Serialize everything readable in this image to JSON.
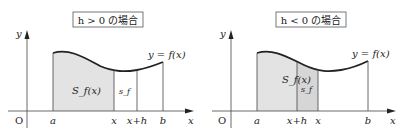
{
  "panels": [
    {
      "title": "h > 0 の場合",
      "y_label": "y",
      "x_label": "x",
      "origin": "O",
      "curve_label": "y = f(x)",
      "area_label": "S_f(x)",
      "strip_label": "s_f",
      "ticks": [
        "a",
        "x",
        "x+h",
        "b"
      ]
    },
    {
      "title": "h < 0 の場合",
      "y_label": "y",
      "x_label": "x",
      "origin": "O",
      "curve_label": "y = f(x)",
      "area_label": "S_f(x)",
      "strip_label": "s_f",
      "ticks": [
        "a",
        "x+h",
        "x",
        "b"
      ]
    }
  ],
  "colors": {
    "shade": "#e3e3e3",
    "shade_strip": "#d6d6d6",
    "line": "#333333"
  }
}
